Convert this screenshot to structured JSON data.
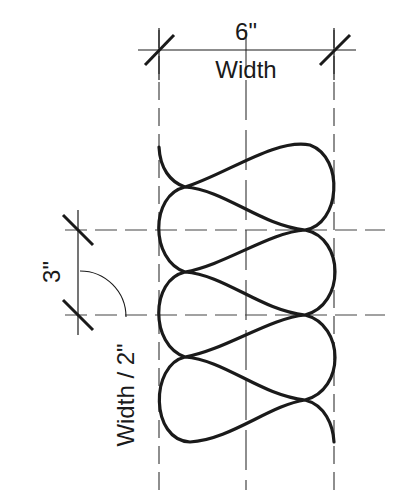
{
  "diagram": {
    "type": "batt-insulation-symbol",
    "colors": {
      "stroke": "#1a1a1a",
      "guide": "#444444",
      "background": "#ffffff"
    },
    "top_dimension": {
      "value": "6\"",
      "label": "Width"
    },
    "left_dimension": {
      "value": "3\"",
      "label": "Width / 2\""
    }
  }
}
